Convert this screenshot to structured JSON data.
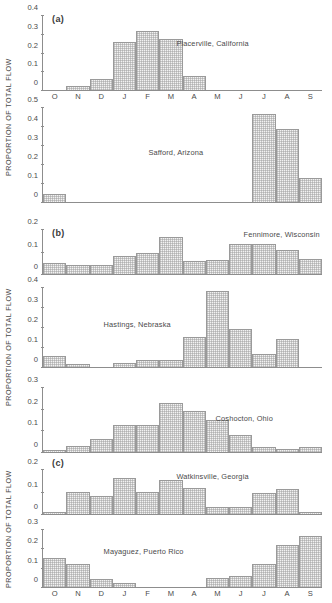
{
  "figure": {
    "axis_title": "PROPORTION OF TOTAL FLOW",
    "months": [
      "O",
      "N",
      "D",
      "J",
      "F",
      "M",
      "A",
      "M",
      "J",
      "J",
      "A",
      "S"
    ],
    "group_tags": {
      "a": "(a)",
      "b": "(b)",
      "c": "(c)"
    }
  },
  "chart_data": [
    {
      "type": "bar",
      "title": "Placerville, California",
      "group": "(a)",
      "categories": [
        "O",
        "N",
        "D",
        "J",
        "F",
        "M",
        "A",
        "M",
        "J",
        "J",
        "A",
        "S"
      ],
      "values": [
        0.0,
        0.02,
        0.06,
        0.26,
        0.32,
        0.275,
        0.075,
        0.0,
        0.0,
        0.0,
        0.0,
        0.0
      ],
      "xlabel": "",
      "ylabel": "PROPORTION OF TOTAL FLOW",
      "ylim": [
        0,
        0.4
      ],
      "yticks": [
        0,
        0.1,
        0.2,
        0.3,
        0.4
      ],
      "ytick_labels": [
        "0",
        "0.1",
        "0.2",
        "0.3",
        "0.4"
      ],
      "grid": false,
      "legend": "none"
    },
    {
      "type": "bar",
      "title": "Safford, Arizona",
      "group": "(a)",
      "categories": [
        "O",
        "N",
        "D",
        "J",
        "F",
        "M",
        "A",
        "M",
        "J",
        "J",
        "A",
        "S"
      ],
      "values": [
        0.04,
        0.0,
        0.0,
        0.0,
        0.0,
        0.0,
        0.0,
        0.0,
        0.0,
        0.47,
        0.39,
        0.13
      ],
      "xlabel": "",
      "ylabel": "PROPORTION OF TOTAL FLOW",
      "ylim": [
        0,
        0.5
      ],
      "yticks": [
        0,
        0.1,
        0.2,
        0.3,
        0.4,
        0.5
      ],
      "ytick_labels": [
        "0",
        "0.1",
        "0.2",
        "0.3",
        "0.4",
        "0.5"
      ],
      "grid": false,
      "legend": "none"
    },
    {
      "type": "bar",
      "title": "Fennimore, Wisconsin",
      "group": "(b)",
      "categories": [
        "O",
        "N",
        "D",
        "J",
        "F",
        "M",
        "A",
        "M",
        "J",
        "J",
        "A",
        "S"
      ],
      "values": [
        0.05,
        0.04,
        0.04,
        0.08,
        0.095,
        0.17,
        0.06,
        0.065,
        0.135,
        0.135,
        0.11,
        0.07
      ],
      "xlabel": "",
      "ylabel": "PROPORTION OF TOTAL FLOW",
      "ylim": [
        0,
        0.2
      ],
      "yticks": [
        0,
        0.1,
        0.2
      ],
      "ytick_labels": [
        "0",
        "0.1",
        "0.2"
      ],
      "grid": false,
      "legend": "none"
    },
    {
      "type": "bar",
      "title": "Hastings, Nebraska",
      "group": "(b)",
      "categories": [
        "O",
        "N",
        "D",
        "J",
        "F",
        "M",
        "A",
        "M",
        "J",
        "J",
        "A",
        "S"
      ],
      "values": [
        0.055,
        0.015,
        0.0,
        0.02,
        0.035,
        0.035,
        0.15,
        0.385,
        0.19,
        0.065,
        0.14,
        0.0
      ],
      "xlabel": "",
      "ylabel": "PROPORTION OF TOTAL FLOW",
      "ylim": [
        0,
        0.4
      ],
      "yticks": [
        0,
        0.1,
        0.2,
        0.3,
        0.4
      ],
      "ytick_labels": [
        "0",
        "0.1",
        "0.2",
        "0.3",
        "0.4"
      ],
      "grid": false,
      "legend": "none"
    },
    {
      "type": "bar",
      "title": "Coshocton, Ohio",
      "group": "(b)",
      "categories": [
        "O",
        "N",
        "D",
        "J",
        "F",
        "M",
        "A",
        "M",
        "J",
        "J",
        "A",
        "S"
      ],
      "values": [
        0.01,
        0.03,
        0.06,
        0.125,
        0.125,
        0.23,
        0.19,
        0.15,
        0.08,
        0.025,
        0.015,
        0.025
      ],
      "xlabel": "",
      "ylabel": "PROPORTION OF TOTAL FLOW",
      "ylim": [
        0,
        0.3
      ],
      "yticks": [
        0,
        0.1,
        0.2,
        0.3
      ],
      "ytick_labels": [
        "0",
        "0.1",
        "0.2",
        "0.3"
      ],
      "grid": false,
      "legend": "none"
    },
    {
      "type": "bar",
      "title": "Watkinsville, Georgia",
      "group": "(c)",
      "categories": [
        "O",
        "N",
        "D",
        "J",
        "F",
        "M",
        "A",
        "M",
        "J",
        "J",
        "A",
        "S"
      ],
      "values": [
        0.01,
        0.1,
        0.08,
        0.165,
        0.1,
        0.155,
        0.12,
        0.03,
        0.03,
        0.095,
        0.115,
        0.01
      ],
      "xlabel": "",
      "ylabel": "PROPORTION OF TOTAL FLOW",
      "ylim": [
        0,
        0.2
      ],
      "yticks": [
        0,
        0.1,
        0.2
      ],
      "ytick_labels": [
        "0",
        "0.1",
        "0.2"
      ],
      "grid": false,
      "legend": "none"
    },
    {
      "type": "bar",
      "title": "Mayaguez, Puerto Rico",
      "group": "(c)",
      "categories": [
        "O",
        "N",
        "D",
        "J",
        "F",
        "M",
        "A",
        "M",
        "J",
        "J",
        "A",
        "S"
      ],
      "values": [
        0.155,
        0.12,
        0.04,
        0.02,
        0.0,
        0.0,
        0.0,
        0.045,
        0.06,
        0.12,
        0.22,
        0.27
      ],
      "xlabel": "",
      "ylabel": "PROPORTION OF TOTAL FLOW",
      "ylim": [
        0,
        0.3
      ],
      "yticks": [
        0,
        0.1,
        0.2,
        0.3
      ],
      "ytick_labels": [
        "0",
        "0.1",
        "0.2",
        "0.3"
      ],
      "grid": false,
      "legend": "none"
    }
  ]
}
